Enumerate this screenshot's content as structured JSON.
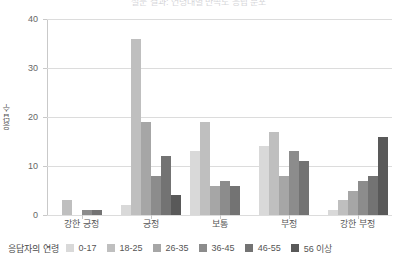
{
  "title": "설문 결과: 연령대별 만족도 응답 분포",
  "legend": {
    "title": "응답자의 연령",
    "items": [
      {
        "label": "0-17",
        "color": "#d9d9d9"
      },
      {
        "label": "18-25",
        "color": "#bfbfbf"
      },
      {
        "label": "26-35",
        "color": "#a6a6a6"
      },
      {
        "label": "36-45",
        "color": "#8c8c8c"
      },
      {
        "label": "46-55",
        "color": "#737373"
      },
      {
        "label": "56 이상",
        "color": "#595959"
      }
    ]
  },
  "chart_data": {
    "type": "bar",
    "title": "설문 결과: 연령대별 만족도 응답 분포",
    "xlabel": "",
    "ylabel": "응답 수",
    "ylim": [
      0,
      40
    ],
    "yticks": [
      0,
      10,
      20,
      30,
      40
    ],
    "grid": true,
    "legend_position": "bottom",
    "legend_title": "응답자의 연령",
    "categories": [
      "강한 긍정",
      "긍정",
      "보통",
      "부정",
      "강한 부정"
    ],
    "series": [
      {
        "name": "0-17",
        "color": "#d9d9d9",
        "values": [
          0,
          2,
          13,
          14,
          1
        ]
      },
      {
        "name": "18-25",
        "color": "#bfbfbf",
        "values": [
          3,
          36,
          19,
          17,
          3
        ]
      },
      {
        "name": "26-35",
        "color": "#a6a6a6",
        "values": [
          0,
          19,
          6,
          8,
          5
        ]
      },
      {
        "name": "36-45",
        "color": "#8c8c8c",
        "values": [
          1,
          8,
          7,
          13,
          7
        ]
      },
      {
        "name": "46-55",
        "color": "#737373",
        "values": [
          1,
          12,
          6,
          11,
          8
        ]
      },
      {
        "name": "56 이상",
        "color": "#595959",
        "values": [
          0,
          4,
          0,
          0,
          16
        ]
      }
    ]
  }
}
